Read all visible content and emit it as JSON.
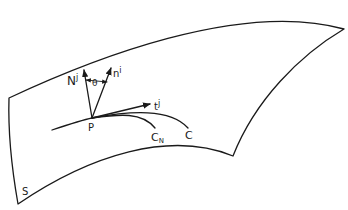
{
  "diagram": {
    "type": "surface-curve-normals",
    "labels": {
      "surface": "S",
      "point": "P",
      "surface_normal": "N",
      "surface_normal_sup": "j",
      "principal_normal": "n",
      "principal_normal_sup": "i",
      "tangent": "t",
      "tangent_sup": "j",
      "angle": "θ",
      "curve": "C",
      "normal_section_curve": "C",
      "normal_section_sub": "N"
    },
    "colors": {
      "line": "#1a1a1a",
      "background": "#ffffff"
    }
  }
}
